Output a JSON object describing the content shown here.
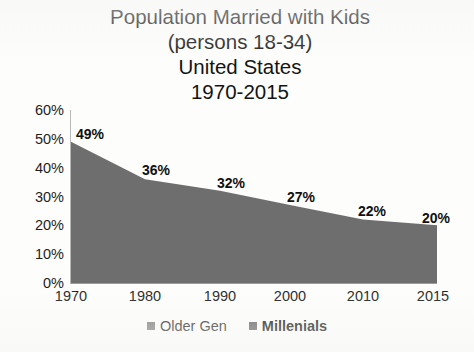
{
  "chart_data": {
    "type": "area",
    "title": "Population Married with Kids (persons 18-34) United States 1970-2015",
    "title_lines": [
      "Population Married with Kids",
      "(persons 18-34)",
      "United States",
      "1970-2015"
    ],
    "categories": [
      "1970",
      "1980",
      "1990",
      "2000",
      "2010",
      "2015"
    ],
    "x": [
      1970,
      1980,
      1990,
      2000,
      2010,
      2015
    ],
    "values": [
      49,
      36,
      32,
      27,
      22,
      20
    ],
    "data_labels": [
      "49%",
      "36%",
      "32%",
      "27%",
      "22%",
      "20%"
    ],
    "xlabel": "",
    "ylabel": "",
    "ylim": [
      0,
      60
    ],
    "ytick_labels": [
      "0%",
      "10%",
      "20%",
      "30%",
      "40%",
      "50%",
      "60%"
    ],
    "ytick_values": [
      0,
      10,
      20,
      30,
      40,
      50,
      60
    ],
    "grid": false,
    "legend_position": "bottom",
    "series": [
      {
        "name": "Older Gen",
        "values": [
          49,
          36,
          32,
          27,
          22,
          20
        ]
      }
    ],
    "legend": [
      {
        "label": "Older Gen",
        "color": "#7a7a7a",
        "bold": false
      },
      {
        "label": "Millenials",
        "color": "#5e5e5e",
        "bold": true
      }
    ],
    "colors": {
      "area_fill": "#6e6e6e",
      "axis": "#9c9c9c",
      "text": "#1a1a1a",
      "background": "#fdfdfc"
    }
  }
}
